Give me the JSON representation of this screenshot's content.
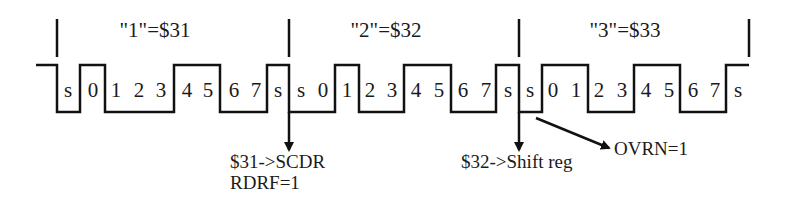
{
  "diagram": {
    "type": "serial-timing-diagram",
    "stroke_color": "#111111",
    "frames": [
      {
        "title": "\"1\"=$31",
        "value_hex": "$31",
        "bit_labels": [
          "s",
          "0",
          "1",
          "2",
          "3",
          "4",
          "5",
          "6",
          "7",
          "s"
        ],
        "bit_levels": [
          0,
          1,
          0,
          0,
          0,
          1,
          1,
          0,
          0,
          1
        ]
      },
      {
        "title": "\"2\"=$32",
        "value_hex": "$32",
        "bit_labels": [
          "s",
          "0",
          "1",
          "2",
          "3",
          "4",
          "5",
          "6",
          "7",
          "s"
        ],
        "bit_levels": [
          0,
          0,
          1,
          0,
          0,
          1,
          1,
          0,
          0,
          1
        ]
      },
      {
        "title": "\"3\"=$33",
        "value_hex": "$33",
        "bit_labels": [
          "s",
          "0",
          "1",
          "2",
          "3",
          "4",
          "5",
          "6",
          "7",
          "s"
        ],
        "bit_levels": [
          0,
          1,
          1,
          0,
          0,
          1,
          1,
          0,
          0,
          1
        ]
      }
    ],
    "annotations": [
      {
        "id": "scdr",
        "lines": [
          "$31->SCDR",
          "RDRF=1"
        ]
      },
      {
        "id": "shift",
        "lines": [
          "$32->Shift reg"
        ]
      },
      {
        "id": "ovrn",
        "lines": [
          "OVRN=1"
        ]
      }
    ]
  }
}
